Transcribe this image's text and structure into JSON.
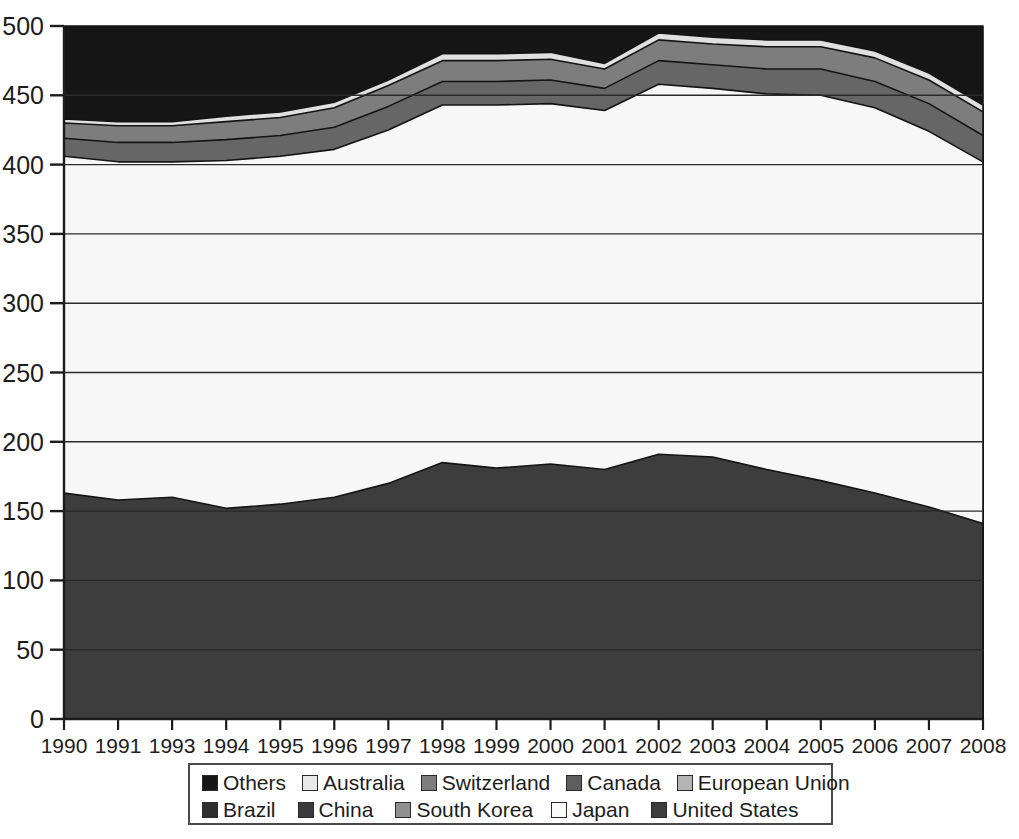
{
  "chart_data": {
    "type": "area",
    "stacked": true,
    "title": "",
    "subtitle": "",
    "xlabel": "",
    "ylabel": "",
    "xlim_labels": [
      "1990",
      "2008"
    ],
    "ylim": [
      0,
      500
    ],
    "y_ticks": [
      "0",
      "50",
      "100",
      "150",
      "200",
      "250",
      "300",
      "350",
      "400",
      "450",
      "500"
    ],
    "y_tick_values": [
      0,
      50,
      100,
      150,
      200,
      250,
      300,
      350,
      400,
      450,
      500
    ],
    "grid": "horizontal",
    "legend_position": "bottom",
    "categories": [
      "1990",
      "1991",
      "1993",
      "1994",
      "1995",
      "1996",
      "1997",
      "1998",
      "1999",
      "2000",
      "2001",
      "2002",
      "2003",
      "2004",
      "2005",
      "2006",
      "2007",
      "2008"
    ],
    "stack_order_bottom_to_top": [
      "United States",
      "China",
      "South Korea",
      "Japan",
      "European Union",
      "Canada",
      "Switzerland",
      "Australia",
      "Brazil",
      "Others"
    ],
    "series": [
      {
        "name": "United States",
        "color": "#3d3d3d",
        "values": [
          163,
          158,
          160,
          152,
          155,
          160,
          170,
          185,
          181,
          184,
          180,
          191,
          189,
          180,
          172,
          163,
          153,
          141
        ]
      },
      {
        "name": "China",
        "color": "#333333",
        "values": [
          0,
          0,
          0,
          0,
          0,
          0,
          0,
          0,
          0,
          0,
          0,
          0,
          0,
          0,
          0,
          0,
          0,
          0
        ]
      },
      {
        "name": "South Korea",
        "color": "#8f8f8f",
        "values": [
          0,
          0,
          0,
          0,
          0,
          0,
          0,
          0,
          0,
          0,
          0,
          0,
          0,
          0,
          0,
          0,
          0,
          0
        ]
      },
      {
        "name": "European Union",
        "color": "#b4b4b4",
        "values": [
          130,
          129,
          126,
          148,
          147,
          145,
          152,
          157,
          150,
          144,
          138,
          151,
          146,
          156,
          165,
          170,
          170,
          166
        ]
      },
      {
        "name": "Japan",
        "color": "#f7f7f7",
        "values": [
          113,
          115,
          116,
          103,
          104,
          106,
          103,
          101,
          112,
          116,
          121,
          116,
          120,
          115,
          113,
          108,
          101,
          95
        ]
      },
      {
        "name": "Brazil",
        "color": "#6b6b6b",
        "values": [
          0,
          0,
          0,
          0,
          0,
          0,
          0,
          0,
          0,
          0,
          0,
          0,
          0,
          0,
          0,
          0,
          0,
          0
        ]
      },
      {
        "name": "Canada",
        "color": "#666666",
        "values": [
          13,
          14,
          14,
          15,
          15,
          16,
          17,
          17,
          17,
          17,
          16,
          17,
          17,
          18,
          19,
          19,
          20,
          19
        ]
      },
      {
        "name": "Switzerland",
        "color": "#7d7d7d",
        "values": [
          11,
          12,
          12,
          13,
          13,
          14,
          15,
          15,
          15,
          15,
          14,
          15,
          15,
          16,
          16,
          17,
          17,
          17
        ]
      },
      {
        "name": "Australia",
        "color": "#e0e0e0",
        "values": [
          3,
          3,
          3,
          4,
          4,
          4,
          4,
          5,
          5,
          5,
          4,
          5,
          5,
          5,
          5,
          5,
          5,
          5
        ]
      },
      {
        "name": "Others",
        "color": "#161616",
        "values": [
          67,
          69,
          69,
          65,
          62,
          55,
          39,
          20,
          20,
          19,
          27,
          5,
          8,
          10,
          10,
          18,
          34,
          57
        ]
      }
    ],
    "band_tops": {
      "United States": [
        163,
        158,
        160,
        152,
        155,
        160,
        170,
        185,
        181,
        184,
        180,
        191,
        189,
        180,
        172,
        163,
        153,
        141
      ],
      "European Union": [
        293,
        287,
        286,
        300,
        302,
        305,
        322,
        342,
        331,
        328,
        318,
        342,
        335,
        336,
        337,
        333,
        323,
        307
      ],
      "Japan": [
        406,
        402,
        402,
        403,
        406,
        411,
        425,
        443,
        443,
        444,
        439,
        458,
        455,
        451,
        450,
        441,
        424,
        402
      ],
      "Canada": [
        419,
        416,
        416,
        418,
        421,
        427,
        442,
        460,
        460,
        461,
        455,
        475,
        472,
        469,
        469,
        460,
        444,
        421
      ],
      "Switzerland": [
        430,
        428,
        428,
        431,
        434,
        441,
        457,
        475,
        475,
        476,
        469,
        490,
        487,
        485,
        485,
        477,
        461,
        438
      ],
      "Australia": [
        433,
        431,
        431,
        435,
        438,
        445,
        461,
        480,
        480,
        481,
        473,
        495,
        492,
        490,
        490,
        482,
        466,
        443
      ],
      "Others": [
        500,
        500,
        500,
        500,
        500,
        500,
        500,
        500,
        500,
        500,
        500,
        500,
        500,
        500,
        500,
        500,
        500,
        500
      ]
    }
  },
  "axes": {
    "y_ticks": [
      "500",
      "450",
      "400",
      "350",
      "300",
      "250",
      "200",
      "150",
      "100",
      "50",
      "0"
    ],
    "x_ticks": [
      "1990",
      "1991",
      "1993",
      "1994",
      "1995",
      "1996",
      "1997",
      "1998",
      "1999",
      "2000",
      "2001",
      "2002",
      "2003",
      "2004",
      "2005",
      "2006",
      "2007",
      "2008"
    ]
  },
  "legend": {
    "rows": [
      [
        {
          "label": "Others",
          "color": "#161616"
        },
        {
          "label": "Australia",
          "color": "#e8e8e8"
        },
        {
          "label": "Switzerland",
          "color": "#7d7d7d"
        },
        {
          "label": "Canada",
          "color": "#5e5e5e"
        },
        {
          "label": "European Union",
          "color": "#b4b4b4"
        }
      ],
      [
        {
          "label": "Brazil",
          "color": "#2e2e2e"
        },
        {
          "label": "China",
          "color": "#3a3a3a"
        },
        {
          "label": "South Korea",
          "color": "#8f8f8f"
        },
        {
          "label": "Japan",
          "color": "#fbfbfb"
        },
        {
          "label": "United States",
          "color": "#3d3d3d"
        }
      ]
    ]
  },
  "colors": {
    "axis": "#1c1c1c",
    "grid": "#2a2a2a",
    "outline": "#141414",
    "background": "#ffffff"
  }
}
